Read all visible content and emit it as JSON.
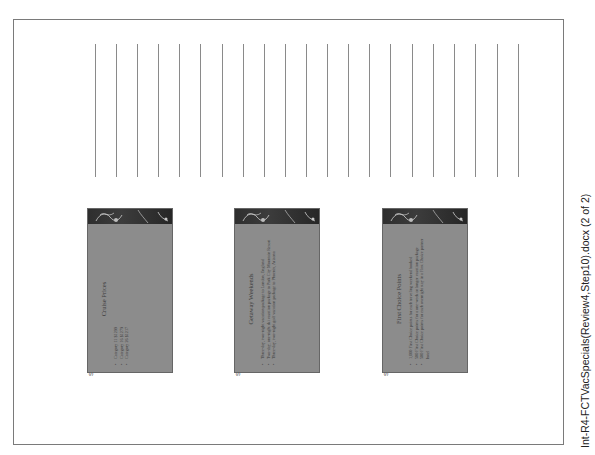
{
  "document": {
    "footer_filename": "Int-R4-FCTVacSpecials(Review4,Step10).docx (2 of 2)",
    "note_lines_count": 21
  },
  "slides": [
    {
      "label": "Slide 4",
      "title": "Cruise Prices",
      "bullets": [
        "Category 11 $1299",
        "Category 16 $1279",
        "Category 26 $1217"
      ]
    },
    {
      "label": "Slide 5",
      "title": "Getaway Weekends",
      "bullets": [
        "Three-day, two-night vacation package to London, England",
        "Two-day, one-night ski vacation package to Park City Mountain Resort",
        "Three-day, two-night golf vacation package to Phoenix, Arizona"
      ]
    },
    {
      "label": "Slide 6",
      "title": "First Choice Points",
      "bullets": [
        "1,000 First Choice points for each traveling weekend booked",
        "500 First Choice points for a one-week or longer vacation package",
        "500 First Choice points for each overnight stay in a First Choice partner hotel"
      ]
    }
  ],
  "colors": {
    "slide_body": "#8c8c8c",
    "slide_header": "#2e2e2e",
    "line": "#8a8a8a",
    "border": "#7a7a7a"
  }
}
